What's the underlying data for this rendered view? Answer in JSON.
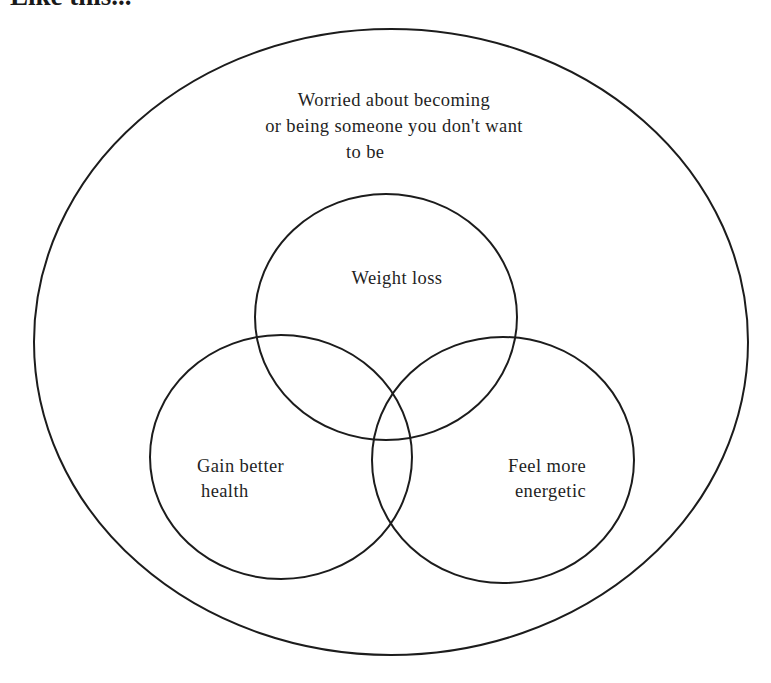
{
  "header": {
    "title": "Like this..."
  },
  "diagram": {
    "type": "venn",
    "stroke_color": "#1c1c1c",
    "background_color": "#ffffff",
    "outer": {
      "label_lines": [
        "Worried about becoming",
        "or being someone you don't want",
        "to be"
      ]
    },
    "circles": [
      {
        "label_lines": [
          "Weight loss"
        ]
      },
      {
        "label_lines": [
          "Gain better",
          "health"
        ]
      },
      {
        "label_lines": [
          "Feel more",
          "energetic"
        ]
      }
    ]
  }
}
